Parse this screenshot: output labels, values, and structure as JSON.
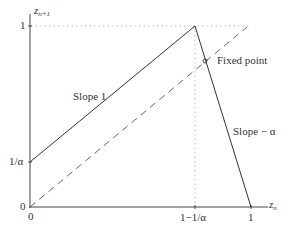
{
  "diagram": {
    "type": "piecewise-linear map (tent-like map) with diagonal",
    "axes": {
      "x_label_base": "z",
      "x_label_sub": "n",
      "y_label_base": "z",
      "y_label_sub": "n+1",
      "x_ticks": [
        "0",
        "1−1/α",
        "1"
      ],
      "y_ticks": [
        "0",
        "1/α",
        "1"
      ]
    },
    "annotations": {
      "slope_left": "Slope 1",
      "slope_right": "Slope − α",
      "fixed_point": "Fixed point"
    },
    "lines": {
      "map_left": {
        "from": [
          0,
          "1/α"
        ],
        "to": [
          "1−1/α",
          1
        ],
        "style": "solid"
      },
      "map_right": {
        "from": [
          "1−1/α",
          1
        ],
        "to": [
          1,
          0
        ],
        "style": "solid"
      },
      "diagonal": {
        "from": [
          0,
          0
        ],
        "to": [
          1,
          1
        ],
        "style": "dashed"
      },
      "guide_horizontal": {
        "at_y": 1,
        "style": "dotted"
      },
      "guide_vertical": {
        "at_x": "1−1/α",
        "style": "dotted"
      }
    },
    "colors": {
      "line": "#333333",
      "guide": "#bbbbbb",
      "background": "#ffffff"
    }
  }
}
